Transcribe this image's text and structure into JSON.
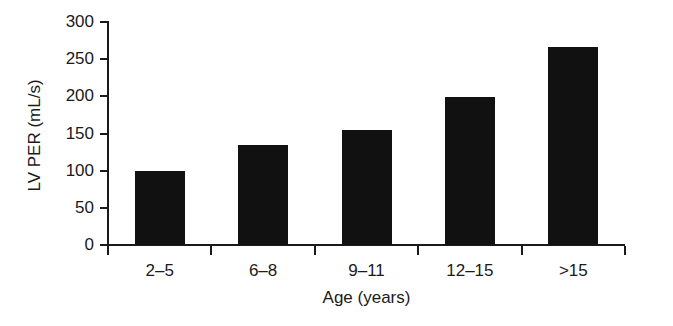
{
  "chart_data": {
    "type": "bar",
    "title": "",
    "xlabel": "Age (years)",
    "ylabel": "LV PER (mL/s)",
    "categories": [
      "2–5",
      "6–8",
      "9–11",
      "12–15",
      ">15"
    ],
    "values": [
      99,
      134,
      155,
      199,
      266
    ],
    "series": [
      {
        "name": "LV PER",
        "values": [
          99,
          134,
          155,
          199,
          266
        ]
      }
    ],
    "ylim": [
      0,
      300
    ],
    "yticks": [
      0,
      50,
      100,
      150,
      200,
      250,
      300
    ],
    "ytick_labels": [
      "0",
      "50",
      "100",
      "150",
      "200",
      "250",
      "300"
    ],
    "xtick_labels": [
      "2–5",
      "6–8",
      "9–11",
      "12–15",
      ">15"
    ],
    "grid": false,
    "legend": false,
    "legend_position": "none",
    "bar_color": "#111111",
    "axis_color": "#1a1a1a",
    "background_color": "#ffffff"
  }
}
